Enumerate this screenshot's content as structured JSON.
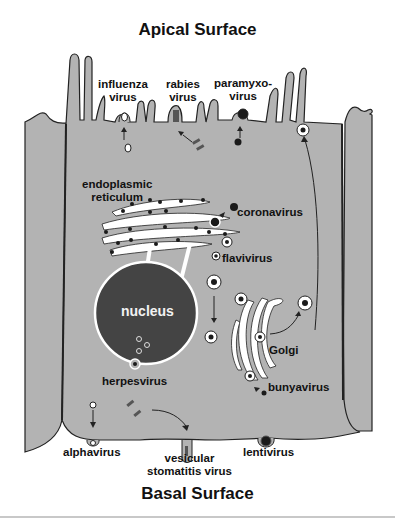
{
  "diagram": {
    "top_title": "Apical Surface",
    "bottom_title": "Basal Surface",
    "colors": {
      "cytoplasm": "#b3b3b3",
      "nucleus": "#444444",
      "membrane": "#222222",
      "organelle_lumen": "#ffffff",
      "virion": "#1a1a1a"
    },
    "organelles": {
      "er": "endoplasmic reticulum",
      "er_line1": "endoplasmic",
      "er_line2": "reticulum",
      "nucleus": "nucleus",
      "golgi": "Golgi"
    },
    "apical_viruses": {
      "influenza_line1": "influenza",
      "influenza_line2": "virus",
      "rabies_line1": "rabies",
      "rabies_line2": "virus",
      "paramyxo_line1": "paramyxo-",
      "paramyxo_line2": "virus"
    },
    "internal_viruses": {
      "coronavirus": "coronavirus",
      "flavivirus": "flavivirus",
      "herpesvirus": "herpesvirus",
      "bunyavirus": "bunyavirus"
    },
    "basal_viruses": {
      "alphavirus": "alphavirus",
      "vsv_line1": "vesicular",
      "vsv_line2": "stomatitis virus",
      "lentivirus": "lentivirus"
    }
  }
}
